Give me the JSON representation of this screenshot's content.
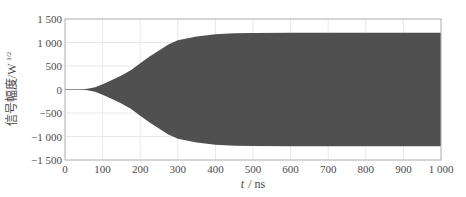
{
  "chart_data": {
    "type": "area",
    "title": "",
    "xlabel": "t / ns",
    "xlabel_italic_part": "t",
    "xlabel_unit": "/ ns",
    "ylabel": "信号幅度/W^1/2",
    "ylabel_text": "信号幅度/W",
    "ylabel_sup": "1/2",
    "xlim": [
      0,
      1000
    ],
    "ylim": [
      -1500,
      1500
    ],
    "xticks": [
      0,
      100,
      200,
      300,
      400,
      500,
      600,
      700,
      800,
      900,
      1000
    ],
    "xtick_labels": [
      "0",
      "100",
      "200",
      "300",
      "400",
      "500",
      "600",
      "700",
      "800",
      "900",
      "1 000"
    ],
    "yticks": [
      1500,
      1000,
      500,
      0,
      -500,
      -1000,
      -1500
    ],
    "ytick_labels": [
      "1 500",
      "1 000",
      "500",
      "0",
      "−500",
      "−1 000",
      "−1 500"
    ],
    "grid": true,
    "legend": null,
    "fill_color": "#505050",
    "series": [
      {
        "name": "envelope (upper)",
        "x": [
          0,
          40,
          60,
          80,
          100,
          125,
          150,
          175,
          200,
          225,
          250,
          275,
          300,
          350,
          400,
          450,
          500,
          600,
          700,
          800,
          900,
          1000
        ],
        "values": [
          0,
          2,
          15,
          50,
          110,
          200,
          300,
          410,
          560,
          700,
          830,
          960,
          1050,
          1130,
          1175,
          1195,
          1200,
          1205,
          1205,
          1205,
          1205,
          1205
        ]
      },
      {
        "name": "envelope (lower)",
        "x": [
          0,
          40,
          60,
          80,
          100,
          125,
          150,
          175,
          200,
          225,
          250,
          275,
          300,
          350,
          400,
          450,
          500,
          600,
          700,
          800,
          900,
          1000
        ],
        "values": [
          0,
          -2,
          -15,
          -50,
          -110,
          -200,
          -300,
          -410,
          -560,
          -700,
          -830,
          -960,
          -1050,
          -1130,
          -1175,
          -1195,
          -1200,
          -1205,
          -1205,
          -1205,
          -1205,
          -1205
        ]
      }
    ]
  }
}
